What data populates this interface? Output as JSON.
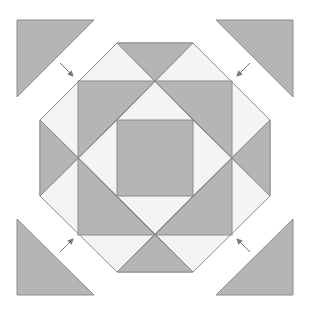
{
  "diagram": {
    "colors": {
      "fill_dark": "#b5b5b5",
      "fill_light": "#f4f4f4",
      "stroke": "#8c8c8c",
      "background": "#ffffff"
    },
    "pieces": {
      "corner_triangles": [
        "top-left",
        "top-right",
        "bottom-left",
        "bottom-right"
      ],
      "arrows": 4
    }
  }
}
